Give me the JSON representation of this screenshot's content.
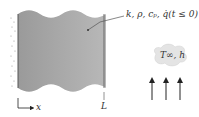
{
  "diagram": {
    "type": "plane-wall-heat-transfer",
    "wall_properties_label": "k, ρ, cₚ, q̇(t ≤ 0)",
    "convection_label": "T∞, h",
    "thickness_label": "L",
    "axis_label": "x",
    "colors": {
      "wall_fill": "#a6a6a6",
      "wall_edge": "#555555",
      "cloud_fill": "#e4e4e4",
      "arrow": "#222222"
    },
    "flow_arrows": 3
  }
}
